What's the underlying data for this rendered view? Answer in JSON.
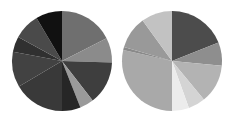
{
  "chart_data": [
    {
      "type": "pie",
      "title": "",
      "legend": null,
      "start_angle_deg": 0,
      "direction": "clockwise",
      "center": [
        62,
        61
      ],
      "radius": 50,
      "slices": [
        {
          "label": "",
          "value": 17.5,
          "color": "#6f6f6f"
        },
        {
          "label": "",
          "value": 8.0,
          "color": "#8b8b8b"
        },
        {
          "label": "",
          "value": 14.0,
          "color": "#3e3e3e"
        },
        {
          "label": "",
          "value": 4.5,
          "color": "#9a9a9a"
        },
        {
          "label": "",
          "value": 6.0,
          "color": "#262626"
        },
        {
          "label": "",
          "value": 16.5,
          "color": "#393939"
        },
        {
          "label": "",
          "value": 11.5,
          "color": "#424242"
        },
        {
          "label": "",
          "value": 5.0,
          "color": "#303030"
        },
        {
          "label": "",
          "value": 8.5,
          "color": "#4a4a4a"
        },
        {
          "label": "",
          "value": 8.5,
          "color": "#111111"
        }
      ]
    },
    {
      "type": "pie",
      "title": "",
      "legend": null,
      "start_angle_deg": 0,
      "direction": "clockwise",
      "center": [
        172,
        61
      ],
      "radius": 50,
      "slices": [
        {
          "label": "",
          "value": 19.0,
          "color": "#4c4c4c"
        },
        {
          "label": "",
          "value": 7.5,
          "color": "#8e8e8e"
        },
        {
          "label": "",
          "value": 12.5,
          "color": "#b3b3b3"
        },
        {
          "label": "",
          "value": 5.5,
          "color": "#d4d4d4"
        },
        {
          "label": "",
          "value": 5.5,
          "color": "#ececec"
        },
        {
          "label": "",
          "value": 28.5,
          "color": "#a9a9a9"
        },
        {
          "label": "",
          "value": 1.0,
          "color": "#8a8a8a"
        },
        {
          "label": "",
          "value": 10.5,
          "color": "#999999"
        },
        {
          "label": "",
          "value": 10.0,
          "color": "#c2c2c2"
        }
      ]
    }
  ]
}
